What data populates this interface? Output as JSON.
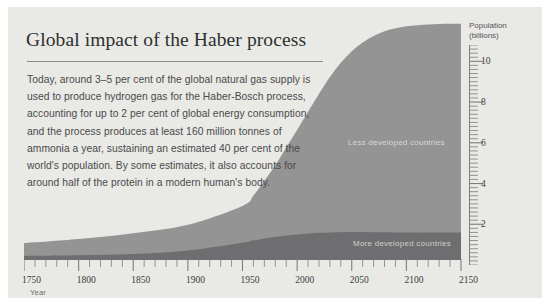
{
  "card": {
    "background": "#e9e9e5"
  },
  "header": {
    "title": "Global impact of the Haber process",
    "body": "Today, around 3–5 per cent of the global natural gas supply is used to produce hydrogen gas for the Haber-Bosch process, accounting for up to 2 per cent of global energy consumption, and the process produces at least 160 million tonnes of ammonia a year, sustaining an estimated 40 per cent of the world's population. By some estimates, it also accounts for around half of the protein in a modern human's body."
  },
  "chart_data": {
    "type": "area",
    "stacked": true,
    "title": "Global impact of the Haber process",
    "xlabel": "Year",
    "ylabel": "Population (billions)",
    "xlim": [
      1750,
      2150
    ],
    "ylim": [
      0,
      10.8
    ],
    "xticks": [
      1750,
      1800,
      1850,
      1900,
      1950,
      2000,
      2050,
      2100,
      2150
    ],
    "xtick_labels": [
      "1750",
      "1800",
      "1850",
      "1900",
      "1950",
      "2000",
      "2050",
      "2100",
      "2150"
    ],
    "x_minor_tick_step": 10,
    "yticks": [
      2,
      4,
      6,
      8,
      10
    ],
    "ytick_labels": [
      "2",
      "4",
      "6",
      "8",
      "10"
    ],
    "y_minor_tick_step": 0.2,
    "grid": false,
    "legend_position": "inline-labels",
    "colors": {
      "less_developed": "#949494",
      "more_developed": "#6e6e70",
      "background": "#e9e9e5",
      "axis": "#55555a"
    },
    "x": [
      1750,
      1800,
      1850,
      1900,
      1950,
      1960,
      1970,
      1980,
      1990,
      2000,
      2010,
      2020,
      2030,
      2040,
      2050,
      2060,
      2070,
      2080,
      2090,
      2100,
      2110,
      2120,
      2130,
      2140,
      2150
    ],
    "series": [
      {
        "name": "More developed countries",
        "values": [
          0.19,
          0.22,
          0.28,
          0.45,
          0.81,
          0.91,
          1.0,
          1.08,
          1.15,
          1.19,
          1.24,
          1.27,
          1.29,
          1.3,
          1.31,
          1.31,
          1.3,
          1.3,
          1.29,
          1.29,
          1.28,
          1.28,
          1.28,
          1.28,
          1.28
        ]
      },
      {
        "name": "Less developed countries",
        "values": [
          0.6,
          0.76,
          0.97,
          1.2,
          1.72,
          2.1,
          2.7,
          3.35,
          4.11,
          4.89,
          5.69,
          6.5,
          7.27,
          7.92,
          8.45,
          8.86,
          9.17,
          9.39,
          9.54,
          9.64,
          9.7,
          9.73,
          9.75,
          9.76,
          9.77
        ]
      }
    ],
    "series_labels": {
      "less_developed": "Less developed countries",
      "more_developed": "More developed countries"
    }
  }
}
